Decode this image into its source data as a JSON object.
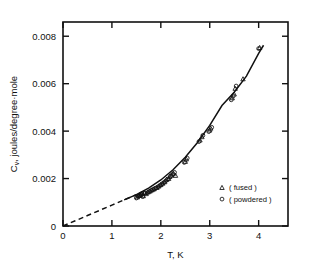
{
  "chart_data": {
    "type": "scatter",
    "title": "",
    "xlabel": "T, K",
    "ylabel": "C_V, joules/degree·mole",
    "ylabel_prefix": "C",
    "ylabel_subscript": "v",
    "ylabel_rest": ", joules/degree·mole",
    "xlim": [
      0,
      4.6
    ],
    "ylim": [
      0,
      0.0086
    ],
    "xticks": [
      0,
      1,
      2,
      3,
      4
    ],
    "xticklabels": [
      "0",
      "1",
      "2",
      "3",
      "4"
    ],
    "yticks": [
      0,
      0.002,
      0.004,
      0.006,
      0.008
    ],
    "yticklabels": [
      "0",
      "0.002",
      "0.004",
      "0.006",
      "0.008"
    ],
    "grid": false,
    "ticks_direction": "in",
    "frame": "box",
    "legend_position": "lower-right-inside",
    "legend": [
      {
        "label": "( fused )",
        "marker": "triangle-open"
      },
      {
        "label": "( powdered )",
        "marker": "circle-open"
      }
    ],
    "fit_curve": {
      "name": "Debye fit",
      "style_solid_from": 1.45,
      "style_dashed_to": 1.45,
      "x": [
        0.0,
        0.25,
        0.5,
        0.75,
        1.0,
        1.25,
        1.5,
        1.75,
        2.0,
        2.25,
        2.5,
        2.75,
        3.0,
        3.25,
        3.5,
        3.75,
        4.0,
        4.1
      ],
      "y": [
        0.0,
        0.00022,
        0.00044,
        0.00066,
        0.00088,
        0.0011,
        0.00132,
        0.0016,
        0.00194,
        0.00237,
        0.0029,
        0.00352,
        0.00424,
        0.00508,
        0.00564,
        0.00632,
        0.00728,
        0.00762
      ]
    },
    "series": [
      {
        "name": "( fused )",
        "marker": "triangle-open",
        "points": [
          [
            1.52,
            0.00122
          ],
          [
            1.55,
            0.00128
          ],
          [
            1.58,
            0.00131
          ],
          [
            1.6,
            0.00134
          ],
          [
            1.62,
            0.00138
          ],
          [
            1.64,
            0.00127
          ],
          [
            1.66,
            0.00141
          ],
          [
            1.7,
            0.00136
          ],
          [
            1.74,
            0.00143
          ],
          [
            1.78,
            0.00147
          ],
          [
            1.82,
            0.00152
          ],
          [
            1.86,
            0.00156
          ],
          [
            1.92,
            0.00162
          ],
          [
            1.96,
            0.00168
          ],
          [
            2.0,
            0.00174
          ],
          [
            2.04,
            0.0018
          ],
          [
            2.08,
            0.00186
          ],
          [
            2.12,
            0.00196
          ],
          [
            2.16,
            0.002
          ],
          [
            2.18,
            0.00208
          ],
          [
            2.22,
            0.00214
          ],
          [
            2.26,
            0.00222
          ],
          [
            2.3,
            0.00213
          ],
          [
            2.5,
            0.00272
          ],
          [
            2.52,
            0.00282
          ],
          [
            2.8,
            0.00362
          ],
          [
            2.84,
            0.00376
          ],
          [
            3.0,
            0.00404
          ],
          [
            3.02,
            0.00412
          ],
          [
            3.46,
            0.0054
          ],
          [
            3.5,
            0.00556
          ],
          [
            3.52,
            0.0058
          ],
          [
            3.68,
            0.0062
          ],
          [
            4.02,
            0.00752
          ]
        ]
      },
      {
        "name": "( powdered )",
        "marker": "circle-open",
        "points": [
          [
            1.5,
            0.00118
          ],
          [
            1.54,
            0.00125
          ],
          [
            1.57,
            0.0013
          ],
          [
            1.59,
            0.00133
          ],
          [
            1.61,
            0.00136
          ],
          [
            1.63,
            0.00124
          ],
          [
            1.68,
            0.00139
          ],
          [
            1.72,
            0.0014
          ],
          [
            1.76,
            0.00145
          ],
          [
            1.8,
            0.0015
          ],
          [
            1.84,
            0.00154
          ],
          [
            1.88,
            0.00158
          ],
          [
            1.9,
            0.0016
          ],
          [
            1.94,
            0.00165
          ],
          [
            1.98,
            0.00171
          ],
          [
            2.02,
            0.00177
          ],
          [
            2.06,
            0.00183
          ],
          [
            2.1,
            0.0019
          ],
          [
            2.14,
            0.00198
          ],
          [
            2.2,
            0.0021
          ],
          [
            2.24,
            0.00218
          ],
          [
            2.28,
            0.00226
          ],
          [
            2.48,
            0.00268
          ],
          [
            2.54,
            0.00286
          ],
          [
            2.78,
            0.00356
          ],
          [
            2.86,
            0.00382
          ],
          [
            2.98,
            0.00398
          ],
          [
            3.04,
            0.00416
          ],
          [
            3.44,
            0.00532
          ],
          [
            3.48,
            0.00548
          ],
          [
            3.54,
            0.0059
          ],
          [
            4.0,
            0.00748
          ]
        ]
      }
    ]
  }
}
